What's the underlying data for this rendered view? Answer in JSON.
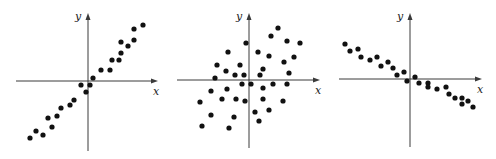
{
  "chart_data": [
    {
      "type": "scatter",
      "title": "",
      "description": "strong positive correlation",
      "xlabel": "x",
      "ylabel": "y",
      "xlim": [
        -7.2,
        7.0
      ],
      "ylim": [
        -7.0,
        6.8
      ],
      "grid": false,
      "points": [
        [
          5.5,
          5.6
        ],
        [
          4.6,
          5.2
        ],
        [
          4.6,
          4.1
        ],
        [
          3.3,
          3.9
        ],
        [
          4.0,
          3.5
        ],
        [
          3.3,
          2.8
        ],
        [
          2.4,
          2.1
        ],
        [
          3.1,
          2.1
        ],
        [
          1.3,
          1.1
        ],
        [
          2.2,
          1.1
        ],
        [
          0.5,
          0.3
        ],
        [
          -0.7,
          -0.4
        ],
        [
          0.2,
          -0.4
        ],
        [
          -0.2,
          -1.1
        ],
        [
          -1.4,
          -1.9
        ],
        [
          -1.8,
          -2.4
        ],
        [
          -2.7,
          -2.7
        ],
        [
          -3.1,
          -3.5
        ],
        [
          -4.0,
          -3.7
        ],
        [
          -3.6,
          -4.6
        ],
        [
          -5.2,
          -5.0
        ],
        [
          -4.5,
          -5.4
        ],
        [
          -5.8,
          -5.7
        ]
      ]
    },
    {
      "type": "scatter",
      "title": "",
      "description": "weak positive correlation",
      "xlabel": "x",
      "ylabel": "y",
      "xlim": [
        -7.2,
        7.1
      ],
      "ylim": [
        -6.8,
        6.7
      ],
      "grid": false,
      "points": [
        [
          2.9,
          5.2
        ],
        [
          2.2,
          4.4
        ],
        [
          3.8,
          3.9
        ],
        [
          5.1,
          3.7
        ],
        [
          -0.3,
          3.7
        ],
        [
          -2.1,
          2.8
        ],
        [
          0.9,
          2.8
        ],
        [
          2.0,
          2.4
        ],
        [
          4.5,
          2.3
        ],
        [
          3.5,
          1.8
        ],
        [
          -3.2,
          1.5
        ],
        [
          -0.9,
          1.5
        ],
        [
          1.4,
          1.1
        ],
        [
          -2.3,
          0.9
        ],
        [
          4.0,
          0.7
        ],
        [
          -1.4,
          0.5
        ],
        [
          -0.5,
          0.5
        ],
        [
          1.1,
          0.5
        ],
        [
          -3.4,
          0.2
        ],
        [
          -0.7,
          -0.4
        ],
        [
          0.2,
          -0.4
        ],
        [
          2.4,
          -0.4
        ],
        [
          3.8,
          -0.4
        ],
        [
          -2.2,
          -0.9
        ],
        [
          1.4,
          -0.8
        ],
        [
          -3.8,
          -1.1
        ],
        [
          -2.7,
          -1.9
        ],
        [
          -1.3,
          -1.9
        ],
        [
          -0.4,
          -2.1
        ],
        [
          1.4,
          -1.9
        ],
        [
          3.4,
          -2.1
        ],
        [
          -4.9,
          -2.2
        ],
        [
          2.0,
          -3.0
        ],
        [
          0.6,
          -3.2
        ],
        [
          -3.8,
          -3.5
        ],
        [
          -1.5,
          -3.7
        ],
        [
          1.0,
          -4.1
        ],
        [
          -4.7,
          -4.6
        ],
        [
          -2.0,
          -4.8
        ]
      ]
    },
    {
      "type": "scatter",
      "title": "",
      "description": "strong negative correlation",
      "xlabel": "x",
      "ylabel": "y",
      "xlim": [
        -7.1,
        7.2
      ],
      "ylim": [
        -6.8,
        6.6
      ],
      "grid": false,
      "points": [
        [
          -6.5,
          3.5
        ],
        [
          -6.0,
          2.8
        ],
        [
          -5.2,
          3.0
        ],
        [
          -4.9,
          2.2
        ],
        [
          -4.0,
          1.9
        ],
        [
          -3.3,
          2.2
        ],
        [
          -2.9,
          1.3
        ],
        [
          -2.2,
          1.7
        ],
        [
          -1.7,
          1.1
        ],
        [
          -1.3,
          0.4
        ],
        [
          -0.6,
          0.7
        ],
        [
          -0.3,
          -0.2
        ],
        [
          0.5,
          0.2
        ],
        [
          0.9,
          -0.4
        ],
        [
          1.8,
          -0.4
        ],
        [
          1.8,
          -0.8
        ],
        [
          2.7,
          -1.0
        ],
        [
          3.6,
          -0.8
        ],
        [
          3.9,
          -1.5
        ],
        [
          4.5,
          -1.9
        ],
        [
          5.2,
          -1.9
        ],
        [
          5.2,
          -2.5
        ],
        [
          5.8,
          -2.2
        ],
        [
          6.3,
          -2.8
        ]
      ]
    }
  ]
}
